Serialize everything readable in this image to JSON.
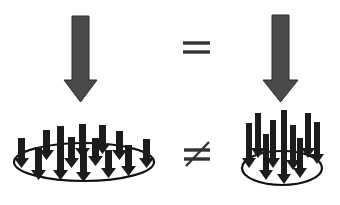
{
  "diagram": {
    "left": {
      "total_force": {
        "icon": "large-down-arrow",
        "color": "#4a4a4a"
      },
      "distribution": {
        "type": "spread",
        "arrow_count": 14,
        "ellipse": {
          "cx": 84,
          "cy": 160,
          "rx": 70,
          "ry": 20
        }
      }
    },
    "right": {
      "total_force": {
        "icon": "large-down-arrow",
        "color": "#4a4a4a"
      },
      "distribution": {
        "type": "concentrated",
        "arrow_count": 10,
        "ellipse": {
          "cx": 282,
          "cy": 163,
          "rx": 40,
          "ry": 20
        }
      }
    },
    "relations": {
      "top": "=",
      "bottom": "≠"
    }
  }
}
